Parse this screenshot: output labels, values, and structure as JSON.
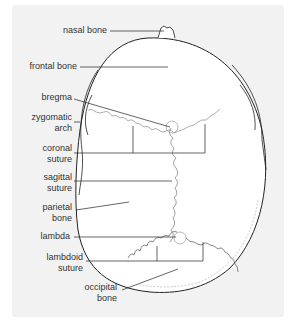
{
  "diagram": {
    "labels": [
      {
        "id": "nasal-bone",
        "text": "nasal bone"
      },
      {
        "id": "frontal-bone",
        "text": "frontal bone"
      },
      {
        "id": "bregma",
        "text": "bregma"
      },
      {
        "id": "zygomatic-arch",
        "text": "zygomatic\narch"
      },
      {
        "id": "coronal-suture",
        "text": "coronal\nsuture"
      },
      {
        "id": "sagittal-suture",
        "text": "sagittal\nsuture"
      },
      {
        "id": "parietal-bone",
        "text": "parietal\nbone"
      },
      {
        "id": "lambda",
        "text": "lambda"
      },
      {
        "id": "lambdoid-suture",
        "text": "lambdoid\nsuture"
      },
      {
        "id": "occipital-bone",
        "text": "occipital\nbone"
      }
    ],
    "colors": {
      "background": "#f2f2f2",
      "skull": "#ffffff",
      "outline": "#222222",
      "suture": "#999999"
    }
  }
}
